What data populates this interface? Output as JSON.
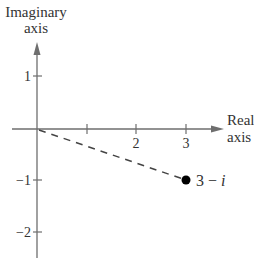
{
  "diagram": {
    "type": "complex-plane",
    "y_axis_label_line1": "Imaginary",
    "y_axis_label_line2": "axis",
    "x_axis_label_line1": "Real",
    "x_axis_label_line2": "axis",
    "x_ticks": [
      "1",
      "2",
      "3"
    ],
    "x_tick_labels_shown": [
      "2",
      "3"
    ],
    "y_ticks": [
      "1",
      "-1",
      "-2"
    ],
    "y_tick_label_1": "1",
    "y_tick_label_neg1": "−1",
    "y_tick_label_neg2": "−2",
    "x_tick_label_2": "2",
    "x_tick_label_3": "3",
    "point": {
      "real": 3,
      "imag": -1,
      "label_main": "3 − ",
      "label_i": "i"
    },
    "line_style": "dashed",
    "colors": {
      "axis": "#6e6e6e",
      "text": "#333333",
      "point": "#000000"
    }
  }
}
